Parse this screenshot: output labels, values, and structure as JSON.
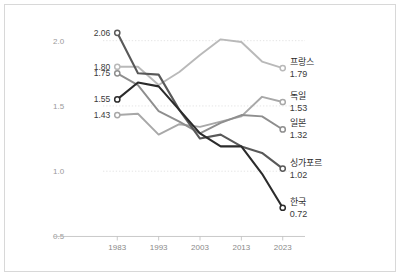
{
  "chart_data": {
    "type": "line",
    "title": "",
    "subtitle": "",
    "xlabel": "",
    "ylabel": "",
    "x": [
      1983,
      1988,
      1993,
      1998,
      2003,
      2008,
      2013,
      2018,
      2023
    ],
    "xlim": [
      1981,
      2025
    ],
    "ylim": [
      0.45,
      2.12
    ],
    "xticks": [
      1983,
      1993,
      2003,
      2013,
      2023
    ],
    "xtick_labels": [
      "1983",
      "1993",
      "2003",
      "2013",
      "2023"
    ],
    "yticks": [
      0.5,
      1.0,
      1.5,
      2.0
    ],
    "ytick_labels": [
      "0.5",
      "1.0",
      "1.5",
      "2.0"
    ],
    "grid": "horizontal-dotted",
    "legend_position": "right-end-labels",
    "series": [
      {
        "name": "프랑스",
        "color": "#b9b9b9",
        "start_label": "1.80",
        "end_label": "1.79",
        "values": [
          1.8,
          1.8,
          1.66,
          1.76,
          1.89,
          2.01,
          1.99,
          1.84,
          1.79
        ]
      },
      {
        "name": "독일",
        "color": "#a8a8a8",
        "start_label": "1.43",
        "end_label": "1.53",
        "values": [
          1.43,
          1.44,
          1.28,
          1.36,
          1.34,
          1.38,
          1.42,
          1.57,
          1.53
        ]
      },
      {
        "name": "일본",
        "color": "#8e8e8e",
        "start_label": "1.75",
        "end_label": "1.32",
        "values": [
          1.75,
          1.66,
          1.46,
          1.38,
          1.29,
          1.37,
          1.43,
          1.42,
          1.32
        ]
      },
      {
        "name": "싱가포르",
        "color": "#595959",
        "start_label": "2.06",
        "end_label": "1.02",
        "values": [
          2.06,
          1.75,
          1.74,
          1.47,
          1.25,
          1.28,
          1.19,
          1.14,
          1.02
        ]
      },
      {
        "name": "한국",
        "color": "#2b2b2b",
        "start_label": "1.55",
        "end_label": "0.72",
        "values": [
          1.55,
          1.68,
          1.65,
          1.47,
          1.29,
          1.19,
          1.19,
          0.98,
          0.72
        ]
      }
    ],
    "left_value_labels": [
      {
        "text": "2.06",
        "value": 2.06
      },
      {
        "text": "1.80",
        "value": 1.8
      },
      {
        "text": "1.75",
        "value": 1.75
      },
      {
        "text": "1.55",
        "value": 1.55
      },
      {
        "text": "1.43",
        "value": 1.43
      }
    ]
  }
}
